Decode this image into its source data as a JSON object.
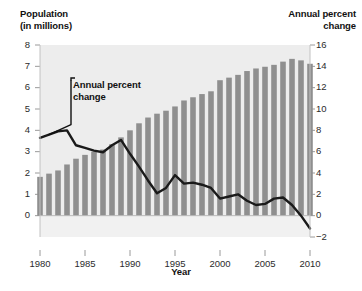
{
  "chart_data": {
    "type": "bar",
    "title": "",
    "xlabel": "Year",
    "left_axis": {
      "label": "Population\n(in millions)",
      "label_line1": "Population",
      "label_line2": "(in millions)",
      "ticks": [
        0,
        1,
        2,
        3,
        4,
        5,
        6,
        7,
        8
      ],
      "ylim": [
        -1,
        8
      ],
      "series_name": "Population (in millions)"
    },
    "right_axis": {
      "label": "Annual percent\nchange",
      "label_line1": "Annual percent",
      "label_line2": "change",
      "ticks": [
        -2,
        0,
        2,
        4,
        6,
        8,
        10,
        12,
        14,
        16
      ],
      "ylim": [
        -2,
        16
      ],
      "series_name": "Annual percent change"
    },
    "x": [
      1980,
      1981,
      1982,
      1983,
      1984,
      1985,
      1986,
      1987,
      1988,
      1989,
      1990,
      1991,
      1992,
      1993,
      1994,
      1995,
      1996,
      1997,
      1998,
      1999,
      2000,
      2001,
      2002,
      2003,
      2004,
      2005,
      2006,
      2007,
      2008,
      2009,
      2010
    ],
    "xticks": [
      1980,
      1985,
      1990,
      1995,
      2000,
      2005,
      2010
    ],
    "grid": false,
    "legend": "none",
    "annotations": [
      {
        "text": "Annual percent\nchange",
        "text_line1": "Annual percent",
        "text_line2": "change",
        "points_to_series": "Annual percent change",
        "points_to_x": 1981
      }
    ],
    "series": [
      {
        "name": "Population (in millions)",
        "type": "bar",
        "axis": "left",
        "color": "#8f8f8f",
        "values": [
          1.82,
          1.97,
          2.12,
          2.4,
          2.67,
          2.85,
          3.0,
          3.1,
          3.35,
          3.67,
          4.0,
          4.33,
          4.6,
          4.78,
          4.92,
          5.12,
          5.4,
          5.55,
          5.7,
          5.83,
          6.35,
          6.47,
          6.6,
          6.78,
          6.9,
          6.98,
          7.07,
          7.22,
          7.35,
          7.28,
          7.12
        ]
      },
      {
        "name": "Annual percent change",
        "type": "line",
        "axis": "right",
        "color": "#1a1a1a",
        "values": [
          7.3,
          7.6,
          7.9,
          8.0,
          6.6,
          6.35,
          6.1,
          5.95,
          6.6,
          7.1,
          5.8,
          4.6,
          3.3,
          2.1,
          2.6,
          3.8,
          3.0,
          3.1,
          2.9,
          2.6,
          1.6,
          1.8,
          2.0,
          1.4,
          1.0,
          1.1,
          1.6,
          1.7,
          1.0,
          0.0,
          -1.2
        ]
      }
    ]
  },
  "figure": {
    "plot_background": "#ededed",
    "page_background": "#ffffff",
    "bar_color": "#8f8f8f",
    "line_color": "#1a1a1a",
    "axis_color": "#9a9a9a",
    "text_color": "#111111"
  }
}
